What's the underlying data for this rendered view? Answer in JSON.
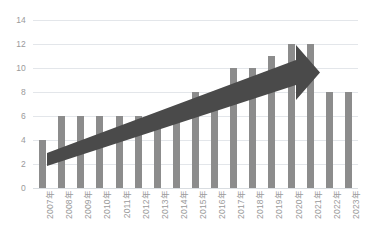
{
  "chart_data": {
    "type": "bar",
    "title": "",
    "subtitle": "",
    "xlabel": "",
    "ylabel": "",
    "categories": [
      "2007年",
      "2008年",
      "2009年",
      "2010年",
      "2011年",
      "2012年",
      "2013年",
      "2014年",
      "2015年",
      "2016年",
      "2017年",
      "2018年",
      "2019年",
      "2020年",
      "2021年",
      "2022年",
      "2023年"
    ],
    "values": [
      4,
      6,
      6,
      6,
      6,
      6,
      6,
      6,
      8,
      8,
      10,
      10,
      11,
      12,
      12,
      8,
      8
    ],
    "ylim": [
      0,
      14
    ],
    "yticks": [
      0,
      2,
      4,
      6,
      8,
      10,
      12,
      14
    ],
    "ytick_labels": [
      "0",
      "2",
      "4",
      "6",
      "8",
      "10",
      "12",
      "14"
    ],
    "grid": true,
    "legend": false,
    "legend_position": "none",
    "bar_color": "#8c8c8c",
    "gridline_color": "#e3e6ea",
    "tick_label_color": "#9a9a9a",
    "background_color": "#ffffff",
    "annotations": [
      {
        "name": "upward-trend-arrow",
        "type": "arrow",
        "color": "#4a4a4a",
        "description": "大きな上向き矢印",
        "from_category": "2008年",
        "to_category": "2021年",
        "from_value": 2.6,
        "to_value": 9.3
      }
    ]
  }
}
